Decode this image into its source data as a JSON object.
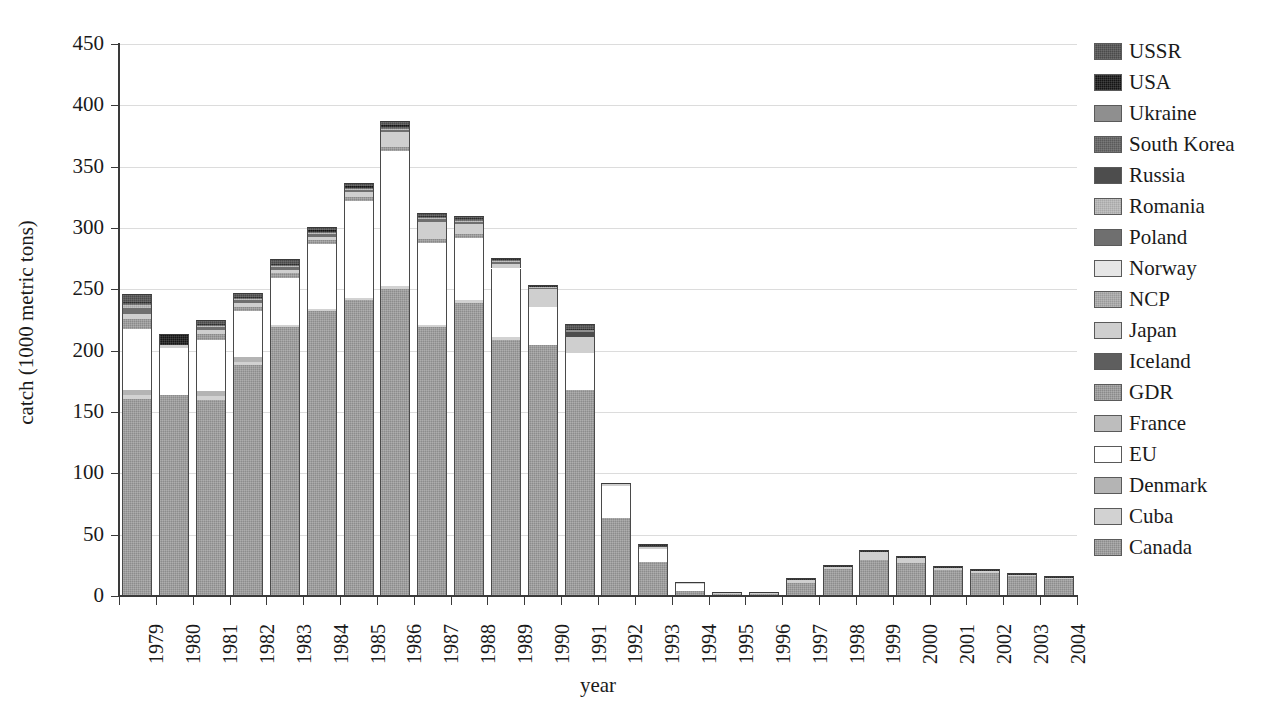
{
  "axes": {
    "ylabel": "catch (1000 metric tons)",
    "xlabel": "year",
    "yticks": [
      "0",
      "50",
      "100",
      "150",
      "200",
      "250",
      "300",
      "350",
      "400",
      "450"
    ],
    "ylim": [
      0,
      450
    ],
    "grid": "horizontal"
  },
  "legend": {
    "position": "right",
    "items": [
      {
        "label": "USSR",
        "color": "#4a4a4a",
        "cls": "f-ussr tex-d"
      },
      {
        "label": "USA",
        "color": "#141414",
        "cls": "f-usa tex-d"
      },
      {
        "label": "Ukraine",
        "color": "#8f8f8f",
        "cls": "f-ukraine"
      },
      {
        "label": "South Korea",
        "color": "#5a5a5a",
        "cls": "f-skorea tex-d"
      },
      {
        "label": "Russia",
        "color": "#4d4d4d",
        "cls": "f-russia"
      },
      {
        "label": "Romania",
        "color": "#a8a8a8",
        "cls": "f-romania tex"
      },
      {
        "label": "Poland",
        "color": "#6f6f6f",
        "cls": "f-poland"
      },
      {
        "label": "Norway",
        "color": "#e6e6e6",
        "cls": "f-norway"
      },
      {
        "label": "NCP",
        "color": "#9a9a9a",
        "cls": "f-ncp tex"
      },
      {
        "label": "Japan",
        "color": "#cfcfcf",
        "cls": "f-japan"
      },
      {
        "label": "Iceland",
        "color": "#5e5e5e",
        "cls": "f-iceland"
      },
      {
        "label": "GDR",
        "color": "#8a8a8a",
        "cls": "f-gdr tex"
      },
      {
        "label": "France",
        "color": "#bdbdbd",
        "cls": "f-france"
      },
      {
        "label": "EU",
        "color": "#ffffff",
        "cls": "f-eu"
      },
      {
        "label": "Denmark",
        "color": "#b4b4b4",
        "cls": "f-denmark"
      },
      {
        "label": "Cuba",
        "color": "#d2d2d2",
        "cls": "f-cuba"
      },
      {
        "label": "Canada",
        "color": "#8c8c8c",
        "cls": "f-canada tex"
      }
    ]
  },
  "chart_data": {
    "type": "bar",
    "subtype": "stacked",
    "title": "",
    "xlabel": "year",
    "ylabel": "catch (1000 metric tons)",
    "ylim": [
      0,
      450
    ],
    "ytick_step": 50,
    "grid": true,
    "legend_position": "right",
    "categories": [
      "1979",
      "1980",
      "1981",
      "1982",
      "1983",
      "1984",
      "1985",
      "1986",
      "1987",
      "1988",
      "1989",
      "1990",
      "1991",
      "1992",
      "1993",
      "1994",
      "1995",
      "1996",
      "1997",
      "1998",
      "1999",
      "2000",
      "2001",
      "2002",
      "2003",
      "2004"
    ],
    "series": [
      {
        "name": "Canada",
        "cls": "f-canada tex",
        "values": [
          161,
          164,
          160,
          188,
          219,
          232,
          241,
          250,
          219,
          239,
          209,
          205,
          168,
          64,
          28,
          4,
          2,
          2,
          11,
          22,
          29,
          27,
          21,
          19,
          16,
          14
        ]
      },
      {
        "name": "Cuba",
        "cls": "f-cuba",
        "values": [
          3,
          0,
          3,
          3,
          2,
          2,
          2,
          3,
          2,
          2,
          2,
          0,
          0,
          0,
          0,
          0,
          0,
          0,
          0,
          0,
          0,
          0,
          0,
          0,
          0,
          0
        ]
      },
      {
        "name": "Denmark",
        "cls": "f-denmark",
        "values": [
          4,
          0,
          4,
          4,
          0,
          0,
          0,
          0,
          0,
          0,
          0,
          0,
          0,
          0,
          0,
          0,
          0,
          0,
          0,
          0,
          0,
          0,
          0,
          0,
          0,
          0
        ]
      },
      {
        "name": "EU",
        "cls": "f-eu",
        "values": [
          50,
          38,
          42,
          37,
          38,
          53,
          79,
          110,
          67,
          51,
          56,
          31,
          30,
          26,
          10,
          6,
          0,
          0,
          0,
          0,
          0,
          0,
          0,
          0,
          0,
          0
        ]
      },
      {
        "name": "France",
        "cls": "f-france",
        "values": [
          0,
          0,
          0,
          0,
          0,
          0,
          0,
          0,
          0,
          0,
          0,
          0,
          0,
          0,
          0,
          0,
          0,
          0,
          0,
          0,
          0,
          0,
          0,
          0,
          0,
          0
        ]
      },
      {
        "name": "GDR",
        "cls": "f-gdr tex",
        "values": [
          8,
          0,
          5,
          4,
          4,
          3,
          3,
          3,
          3,
          3,
          0,
          0,
          0,
          0,
          0,
          0,
          0,
          0,
          0,
          0,
          0,
          0,
          0,
          0,
          0,
          0
        ]
      },
      {
        "name": "Iceland",
        "cls": "f-iceland",
        "values": [
          0,
          0,
          0,
          0,
          0,
          0,
          0,
          0,
          0,
          0,
          0,
          0,
          0,
          0,
          0,
          0,
          0,
          0,
          0,
          0,
          0,
          0,
          0,
          0,
          0,
          0
        ]
      },
      {
        "name": "Japan",
        "cls": "f-japan",
        "values": [
          4,
          3,
          3,
          3,
          3,
          3,
          4,
          12,
          14,
          8,
          4,
          14,
          13,
          2,
          2,
          1,
          1,
          1,
          2,
          2,
          7,
          4,
          2,
          1,
          1,
          1
        ]
      },
      {
        "name": "NCP",
        "cls": "f-ncp tex",
        "values": [
          0,
          0,
          0,
          0,
          0,
          0,
          0,
          0,
          0,
          0,
          0,
          0,
          0,
          0,
          0,
          0,
          0,
          0,
          0,
          0,
          0,
          0,
          0,
          0,
          0,
          0
        ]
      },
      {
        "name": "Norway",
        "cls": "f-norway",
        "values": [
          0,
          0,
          0,
          0,
          0,
          0,
          0,
          0,
          0,
          0,
          0,
          0,
          0,
          0,
          0,
          0,
          0,
          0,
          0,
          0,
          0,
          0,
          0,
          0,
          0,
          0
        ]
      },
      {
        "name": "Poland",
        "cls": "f-poland",
        "values": [
          5,
          0,
          2,
          2,
          2,
          2,
          2,
          2,
          2,
          2,
          1,
          1,
          0,
          0,
          0,
          0,
          0,
          0,
          0,
          0,
          0,
          0,
          0,
          0,
          0,
          0
        ]
      },
      {
        "name": "Romania",
        "cls": "f-romania tex",
        "values": [
          2,
          0,
          1,
          1,
          1,
          1,
          1,
          1,
          1,
          1,
          1,
          1,
          0,
          0,
          0,
          0,
          0,
          0,
          0,
          0,
          0,
          0,
          0,
          0,
          0,
          0
        ]
      },
      {
        "name": "Russia",
        "cls": "f-russia",
        "values": [
          0,
          0,
          0,
          0,
          0,
          0,
          0,
          0,
          0,
          0,
          0,
          0,
          4,
          0,
          1,
          0,
          0,
          0,
          0,
          0,
          0,
          0,
          0,
          0,
          0,
          0
        ]
      },
      {
        "name": "South Korea",
        "cls": "f-skorea tex-d",
        "values": [
          2,
          0,
          1,
          1,
          1,
          1,
          1,
          1,
          1,
          1,
          1,
          0,
          0,
          0,
          0,
          0,
          0,
          0,
          0,
          0,
          0,
          0,
          0,
          0,
          0,
          0
        ]
      },
      {
        "name": "Ukraine",
        "cls": "f-ukraine",
        "values": [
          0,
          0,
          0,
          0,
          0,
          0,
          0,
          0,
          0,
          0,
          0,
          0,
          2,
          0,
          0,
          0,
          0,
          0,
          0,
          0,
          0,
          0,
          0,
          0,
          0,
          0
        ]
      },
      {
        "name": "USA",
        "cls": "f-usa tex-d",
        "values": [
          1,
          9,
          1,
          1,
          1,
          1,
          1,
          2,
          1,
          1,
          1,
          1,
          1,
          0,
          1,
          0,
          0,
          0,
          1,
          1,
          1,
          1,
          1,
          1,
          1,
          1
        ]
      },
      {
        "name": "USSR",
        "cls": "f-ussr tex-d",
        "values": [
          6,
          0,
          3,
          3,
          4,
          3,
          3,
          3,
          2,
          2,
          0,
          0,
          4,
          0,
          0,
          0,
          0,
          0,
          0,
          0,
          0,
          0,
          0,
          0,
          0,
          0
        ]
      }
    ],
    "totals": [
      246,
      214,
      225,
      247,
      275,
      301,
      337,
      387,
      311,
      309,
      274,
      253,
      222,
      92,
      42,
      11,
      3,
      3,
      14,
      25,
      37,
      32,
      24,
      21,
      18,
      16
    ]
  }
}
